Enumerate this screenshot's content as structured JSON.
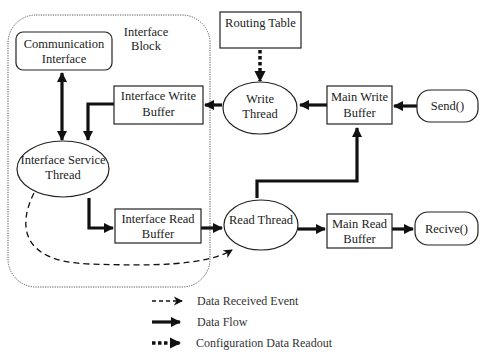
{
  "diagram": {
    "interface_block": {
      "label_line1": "Interface",
      "label_line2": "Block"
    },
    "nodes": {
      "communication_interface": {
        "line1": "Communication",
        "line2": "Interface",
        "shape": "rounded-rect"
      },
      "routing_table": {
        "line1": "Routing Table",
        "shape": "rect"
      },
      "interface_write_buffer": {
        "line1": "Interface Write",
        "line2": "Buffer",
        "shape": "rect"
      },
      "write_thread": {
        "line1": "Write",
        "line2": "Thread",
        "shape": "ellipse"
      },
      "main_write_buffer": {
        "line1": "Main Write",
        "line2": "Buffer",
        "shape": "rect"
      },
      "send": {
        "line1": "Send()",
        "shape": "rounded-rect"
      },
      "interface_service_thread": {
        "line1": "Interface Service",
        "line2": "Thread",
        "shape": "ellipse"
      },
      "interface_read_buffer": {
        "line1": "Interface Read",
        "line2": "Buffer",
        "shape": "rect"
      },
      "read_thread": {
        "line1": "Read Thread",
        "shape": "ellipse"
      },
      "main_read_buffer": {
        "line1": "Main Read",
        "line2": "Buffer",
        "shape": "rect"
      },
      "recive": {
        "line1": "Recive()",
        "shape": "rounded-rect"
      }
    },
    "edges": [
      {
        "from": "communication_interface",
        "to": "interface_service_thread",
        "type": "data-flow",
        "bidirectional": true
      },
      {
        "from": "interface_write_buffer",
        "to": "interface_service_thread",
        "type": "data-flow"
      },
      {
        "from": "write_thread",
        "to": "interface_write_buffer",
        "type": "data-flow"
      },
      {
        "from": "routing_table",
        "to": "write_thread",
        "type": "configuration-data-readout"
      },
      {
        "from": "main_write_buffer",
        "to": "write_thread",
        "type": "data-flow"
      },
      {
        "from": "send",
        "to": "main_write_buffer",
        "type": "data-flow"
      },
      {
        "from": "interface_service_thread",
        "to": "interface_read_buffer",
        "type": "data-flow"
      },
      {
        "from": "interface_read_buffer",
        "to": "read_thread",
        "type": "data-flow"
      },
      {
        "from": "interface_service_thread",
        "to": "read_thread",
        "type": "data-received-event"
      },
      {
        "from": "read_thread",
        "to": "main_write_buffer",
        "type": "data-flow"
      },
      {
        "from": "read_thread",
        "to": "main_read_buffer",
        "type": "data-flow"
      },
      {
        "from": "main_read_buffer",
        "to": "recive",
        "type": "data-flow"
      }
    ],
    "legend": [
      {
        "style": "dashed-thin",
        "label": "Data Received Event"
      },
      {
        "style": "solid-thick",
        "label": "Data Flow"
      },
      {
        "style": "dotted-thick",
        "label": "Configuration Data Readout"
      }
    ]
  }
}
